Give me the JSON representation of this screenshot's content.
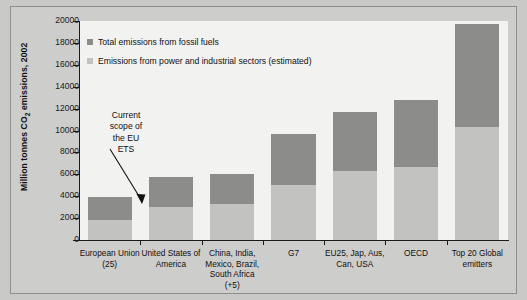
{
  "chart_data": {
    "type": "bar",
    "stacked": true,
    "title": "",
    "xlabel": "",
    "ylabel": "Million tonnes CO2 emissions, 2002",
    "ylabel_parts": {
      "pre": "Million tonnes CO",
      "sub": "2",
      "post": " emissions, 2002"
    },
    "ylim": [
      0,
      20000
    ],
    "ytick_values": [
      0,
      2000,
      4000,
      6000,
      8000,
      10000,
      12000,
      14000,
      16000,
      18000,
      20000
    ],
    "ytick_labels": [
      "0",
      "2000",
      "4000",
      "6000",
      "8000",
      "10000",
      "12000",
      "14000",
      "16000",
      "18000",
      "20000"
    ],
    "grid": false,
    "legend_position": "inside-top-left",
    "categories": [
      "European Union (25)",
      "United States of America",
      "China, India, Mexico, Brazil, South Africa (+5)",
      "G7",
      "EU25, Jap, Aus, Can, USA",
      "OECD",
      "Top 20 Global emitters"
    ],
    "category_label_lines": [
      [
        "European Union",
        "(25)"
      ],
      [
        "United States of",
        "America"
      ],
      [
        "China, India,",
        "Mexico, Brazil,",
        "South Africa",
        "(+5)"
      ],
      [
        "G7"
      ],
      [
        "EU25, Jap, Aus,",
        "Can, USA"
      ],
      [
        "OECD"
      ],
      [
        "Top 20 Global",
        "emitters"
      ]
    ],
    "series": [
      {
        "name": "Emissions from power and industrial sectors (estimated)",
        "color": "#c2c2c0",
        "values": [
          1800,
          3050,
          3300,
          5000,
          6300,
          6700,
          10300
        ]
      },
      {
        "name": "Total emissions from fossil fuels",
        "color": "#8c8c8a",
        "values": [
          3900,
          5750,
          6000,
          9700,
          11700,
          12800,
          19700
        ]
      }
    ],
    "annotations": [
      {
        "text": "Current scope of the EU ETS",
        "text_lines": [
          "Current",
          "scope of",
          "the EU",
          "ETS"
        ],
        "target_category": "European Union (25)"
      }
    ]
  },
  "legend": {
    "items": [
      {
        "label": "Total emissions from fossil fuels",
        "color": "#8c8c8a"
      },
      {
        "label": "Emissions from power and industrial sectors (estimated)",
        "color": "#c2c2c0"
      }
    ]
  },
  "colors": {
    "dark_series": "#8c8c8a",
    "light_series": "#c2c2c0",
    "plot_background": "#f2f2f0",
    "figure_background": "#cdcdcb",
    "axis": "#1a1a1a"
  }
}
